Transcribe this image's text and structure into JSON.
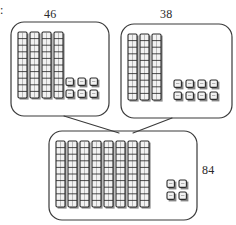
{
  "diagram": {
    "type": "base-ten-block-addition",
    "edge_mark": ":",
    "stroke_color": "#3a3a3a",
    "block_outline_color": "#2b2b2b",
    "block_fill_color": "#f2f2f2",
    "background_color": "#ffffff",
    "boxes": [
      {
        "id": "addend-one",
        "label": "46",
        "label_position": "top",
        "tens": 4,
        "ones": 6,
        "ones_columns": 3,
        "ones_rows": 2,
        "x": 11,
        "y": 22,
        "w": 98,
        "h": 94,
        "rod_x": 18,
        "rod_y": 32,
        "ones_x": 66,
        "ones_y": 78
      },
      {
        "id": "addend-two",
        "label": "38",
        "label_position": "top",
        "tens": 3,
        "ones": 8,
        "ones_columns": 4,
        "ones_rows": 2,
        "x": 121,
        "y": 24,
        "w": 111,
        "h": 94,
        "rod_x": 128,
        "rod_y": 34,
        "ones_x": 174,
        "ones_y": 80
      },
      {
        "id": "sum",
        "label": "84",
        "label_position": "right",
        "tens": 8,
        "ones": 4,
        "ones_columns": 2,
        "ones_rows": 2,
        "x": 49,
        "y": 131,
        "w": 148,
        "h": 89,
        "rod_x": 56,
        "rod_y": 141,
        "ones_x": 167,
        "ones_y": 180
      }
    ],
    "connectors": [
      {
        "id": "connector-left",
        "from_box": "addend-one",
        "to_box": "sum",
        "x1": 64,
        "y1": 116,
        "x2": 119,
        "y2": 133
      },
      {
        "id": "connector-right",
        "from_box": "addend-two",
        "to_box": "sum",
        "x1": 172,
        "y1": 118,
        "x2": 133,
        "y2": 133
      }
    ],
    "rod": {
      "segments": 10,
      "width": 9,
      "segment_height": 6.6
    },
    "unit": {
      "width": 9,
      "height": 9,
      "gap_x": 12,
      "gap_y": 12
    }
  }
}
